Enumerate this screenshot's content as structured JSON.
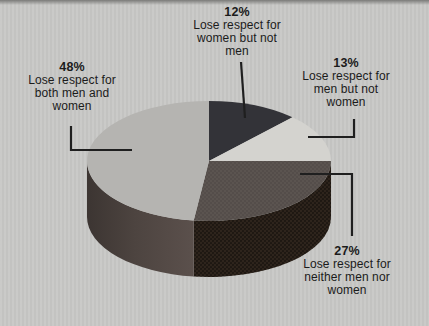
{
  "background_color": "#c8c8c6",
  "text_color": "#1b1b1b",
  "leader_line_color": "#1f1f1f",
  "chart_data": {
    "type": "pie",
    "style": "3d",
    "direction": "clockwise",
    "start_angle_deg": 0,
    "title": "",
    "legend": "none",
    "slices": [
      {
        "id": "women-not-men",
        "value": 12,
        "display": "12%",
        "label": "Lose respect for women but not men",
        "top_color": "#333338"
      },
      {
        "id": "men-not-women",
        "value": 13,
        "display": "13%",
        "label": "Lose respect for men but not women",
        "top_color": "#d4d3cf"
      },
      {
        "id": "neither",
        "value": 27,
        "display": "27%",
        "label": "Lose respect for neither men nor women",
        "top_color": "#5b5450",
        "side_color": "#2e241c"
      },
      {
        "id": "both",
        "value": 48,
        "display": "48%",
        "label": "Lose respect for both men and women",
        "top_color": "#b5b4b1",
        "side_color": "#4d4440"
      }
    ]
  },
  "labels": {
    "p12": {
      "pct": "12%",
      "lines": [
        "Lose respect for",
        "women but not",
        "men"
      ]
    },
    "p13": {
      "pct": "13%",
      "lines": [
        "Lose respect for",
        "men but not",
        "women"
      ]
    },
    "p48": {
      "pct": "48%",
      "lines": [
        "Lose respect for",
        "both men and",
        "women"
      ]
    },
    "p27": {
      "pct": "27%",
      "lines": [
        "Lose respect for",
        "neither men nor",
        "women"
      ]
    }
  }
}
